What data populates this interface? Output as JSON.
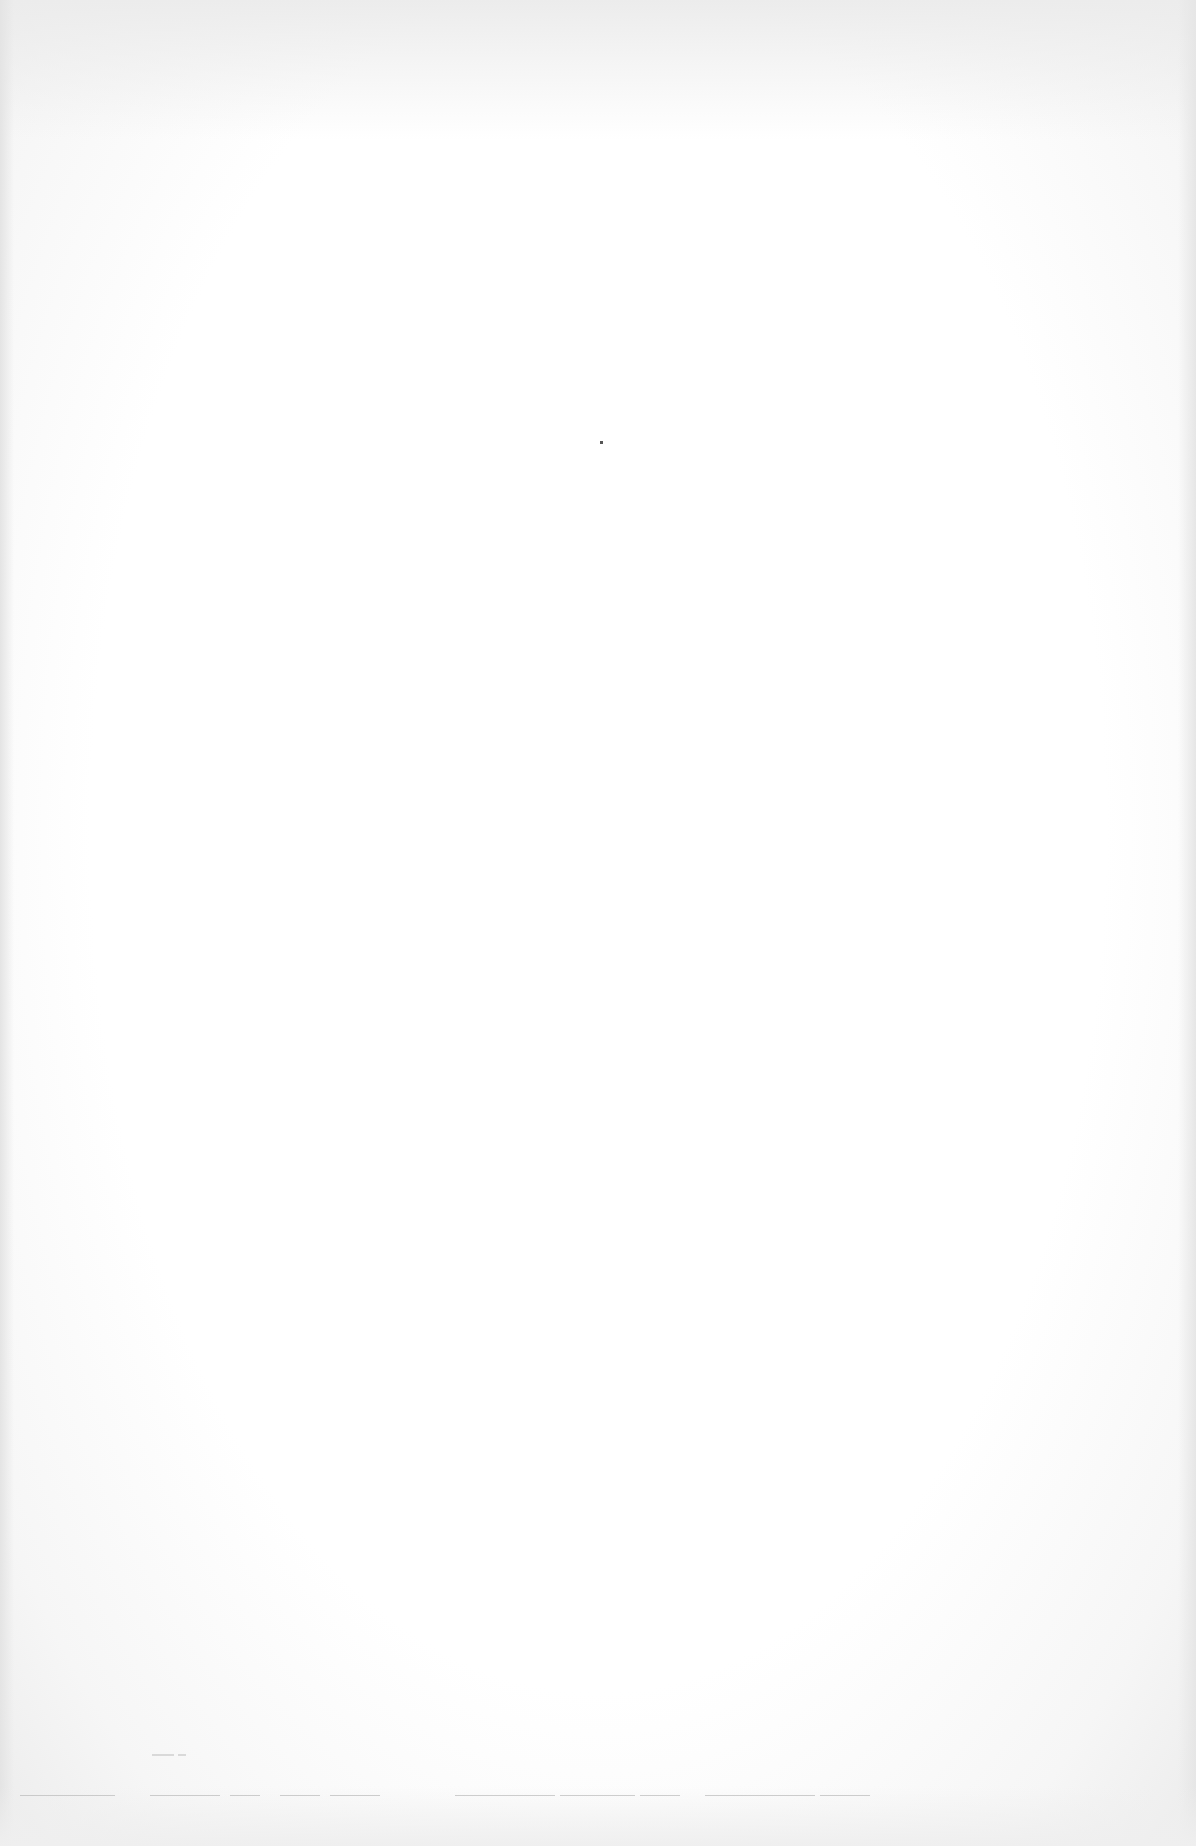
{
  "page": {
    "type": "blank scanned page",
    "visible_text": "",
    "marks": {
      "bleed_through_lines": [
        {
          "x": 20,
          "y": 1795,
          "w": 95
        },
        {
          "x": 150,
          "y": 1795,
          "w": 70
        },
        {
          "x": 230,
          "y": 1795,
          "w": 30
        },
        {
          "x": 280,
          "y": 1795,
          "w": 40
        },
        {
          "x": 330,
          "y": 1795,
          "w": 50
        },
        {
          "x": 455,
          "y": 1795,
          "w": 100
        },
        {
          "x": 560,
          "y": 1795,
          "w": 75
        },
        {
          "x": 640,
          "y": 1795,
          "w": 40
        },
        {
          "x": 705,
          "y": 1795,
          "w": 110
        },
        {
          "x": 820,
          "y": 1795,
          "w": 50
        }
      ],
      "faint_marks": [
        {
          "x": 152,
          "y": 1754,
          "w": 22
        },
        {
          "x": 178,
          "y": 1754,
          "w": 8
        }
      ]
    }
  }
}
